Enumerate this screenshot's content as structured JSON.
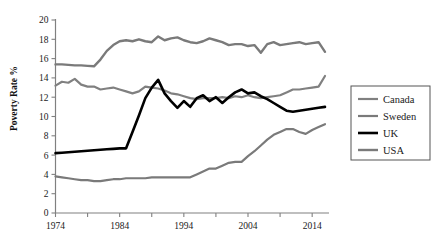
{
  "chart_data": {
    "type": "line",
    "title": "",
    "xlabel": "",
    "ylabel": "Poverty Rate %",
    "xlim": [
      1974,
      2016
    ],
    "ylim": [
      0,
      20
    ],
    "ytick_step": 2,
    "yticks": [
      0,
      2,
      4,
      6,
      8,
      10,
      12,
      14,
      16,
      18,
      20
    ],
    "ytick_labels": [
      "0",
      "2",
      "4",
      "6",
      "8",
      "10",
      "12",
      "14",
      "16",
      "18",
      "20"
    ],
    "xticks": [
      1974,
      1979,
      1984,
      1989,
      1994,
      1999,
      2004,
      2009,
      2014
    ],
    "xtick_labels": [
      "1974",
      "",
      "1984",
      "",
      "1994",
      "",
      "2004",
      "",
      "2014"
    ],
    "xtick_labels_shown": [
      "1974",
      "1984",
      "1994",
      "2004",
      "2014"
    ],
    "grid": false,
    "legend_position": "right",
    "x": [
      1974,
      1975,
      1976,
      1977,
      1978,
      1979,
      1980,
      1981,
      1982,
      1983,
      1984,
      1985,
      1986,
      1987,
      1988,
      1989,
      1990,
      1991,
      1992,
      1993,
      1994,
      1995,
      1996,
      1997,
      1998,
      1999,
      2000,
      2001,
      2002,
      2003,
      2004,
      2005,
      2006,
      2007,
      2008,
      2009,
      2010,
      2011,
      2012,
      2013,
      2014,
      2015,
      2016
    ],
    "series": [
      {
        "name": "Canada",
        "color": "#808080",
        "width": 2.2,
        "values": [
          13.2,
          13.6,
          13.5,
          13.9,
          13.3,
          13.1,
          13.1,
          12.8,
          12.9,
          13.0,
          12.8,
          12.6,
          12.4,
          12.6,
          13.1,
          13.0,
          12.9,
          12.7,
          12.4,
          12.3,
          12.1,
          11.9,
          11.8,
          11.9,
          11.9,
          11.9,
          12.0,
          11.9,
          12.1,
          12.0,
          12.2,
          12.0,
          11.9,
          12.0,
          12.1,
          12.2,
          12.5,
          12.8,
          12.8,
          12.9,
          13.0,
          13.1,
          14.2
        ]
      },
      {
        "name": "Sweden",
        "color": "#7a7a7a",
        "width": 2.2,
        "values": [
          3.8,
          3.7,
          3.6,
          3.5,
          3.4,
          3.4,
          3.3,
          3.3,
          3.4,
          3.5,
          3.5,
          3.6,
          3.6,
          3.6,
          3.6,
          3.7,
          3.7,
          3.7,
          3.7,
          3.7,
          3.7,
          3.7,
          4.0,
          4.3,
          4.6,
          4.6,
          4.9,
          5.2,
          5.3,
          5.3,
          5.9,
          6.4,
          7.0,
          7.6,
          8.1,
          8.4,
          8.7,
          8.7,
          8.4,
          8.2,
          8.6,
          8.9,
          9.2
        ]
      },
      {
        "name": "UK",
        "color": "#000000",
        "width": 2.6,
        "values": [
          6.2,
          6.25,
          6.3,
          6.35,
          6.4,
          6.45,
          6.5,
          6.55,
          6.6,
          6.65,
          6.7,
          6.7,
          8.4,
          10.1,
          11.9,
          13.0,
          13.8,
          12.4,
          11.6,
          10.9,
          11.6,
          11.0,
          11.9,
          12.2,
          11.6,
          12.0,
          11.4,
          12.0,
          12.5,
          12.8,
          12.4,
          12.5,
          12.1,
          11.8,
          11.4,
          11.0,
          10.6,
          10.5,
          10.6,
          10.7,
          10.8,
          10.9,
          11.0
        ]
      },
      {
        "name": "USA",
        "color": "#7a7a7a",
        "width": 2.4,
        "values": [
          15.4,
          15.4,
          15.35,
          15.3,
          15.3,
          15.25,
          15.2,
          15.9,
          16.8,
          17.4,
          17.8,
          17.9,
          17.8,
          18.0,
          17.8,
          17.7,
          18.3,
          17.9,
          18.1,
          18.2,
          17.9,
          17.7,
          17.6,
          17.8,
          18.1,
          17.9,
          17.7,
          17.4,
          17.5,
          17.5,
          17.3,
          17.4,
          16.6,
          17.5,
          17.7,
          17.4,
          17.5,
          17.6,
          17.7,
          17.5,
          17.6,
          17.7,
          16.7
        ]
      }
    ]
  },
  "legend": {
    "entries": [
      {
        "label": "Canada",
        "color": "#808080"
      },
      {
        "label": "Sweden",
        "color": "#7a7a7a"
      },
      {
        "label": "UK",
        "color": "#000000"
      },
      {
        "label": "USA",
        "color": "#7a7a7a"
      }
    ]
  },
  "axes": {
    "axis_color": "#808080",
    "y_axis_title": "Poverty Rate %"
  }
}
